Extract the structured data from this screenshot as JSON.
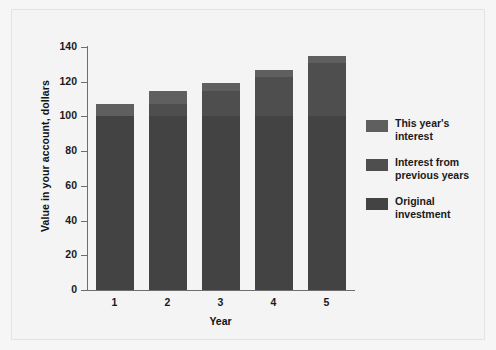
{
  "figure": {
    "background_color": "#f4f4f4",
    "border_color": "#e3e3e3"
  },
  "chart_data": {
    "type": "bar",
    "subtype": "stacked-bar",
    "title": "",
    "xlabel": "Year",
    "ylabel": "Value in your account, dollars",
    "categories": [
      "1",
      "2",
      "3",
      "4",
      "5"
    ],
    "ylim": [
      0,
      140
    ],
    "yticks": [
      0,
      20,
      40,
      60,
      80,
      100,
      120,
      140
    ],
    "ytick_labels": [
      "0",
      "20",
      "40",
      "60",
      "80",
      "100",
      "120",
      "140"
    ],
    "grid": false,
    "legend_position": "right",
    "series": [
      {
        "name": "Original investment",
        "color": "#434343",
        "values": [
          100,
          100,
          100,
          100,
          100
        ]
      },
      {
        "name": "Interest from previous years",
        "color": "#4e4e4e",
        "values": [
          0,
          7,
          14.5,
          22.5,
          31
        ]
      },
      {
        "name": "This year's interest",
        "color": "#5f5f5f",
        "values": [
          7,
          7.5,
          4.5,
          4.5,
          4
        ]
      }
    ],
    "totals": [
      107,
      114.5,
      119,
      127,
      135
    ]
  },
  "legend": {
    "entries": [
      {
        "label_line1": "This year's",
        "label_line2": "interest",
        "color": "#5f5f5f"
      },
      {
        "label_line1": "Interest from",
        "label_line2": "previous years",
        "color": "#4e4e4e"
      },
      {
        "label_line1": "Original",
        "label_line2": "investment",
        "color": "#434343"
      }
    ]
  }
}
